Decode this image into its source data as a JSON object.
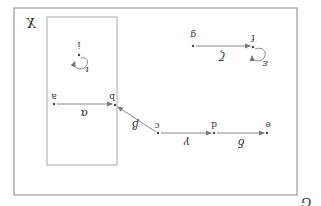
{
  "diagram": {
    "orientation": "rotated-180",
    "outer_box": {
      "label": "G",
      "x": 14,
      "y": 8,
      "w": 283,
      "h": 187
    },
    "inner_box": {
      "label": "X",
      "x": 47,
      "y": 17,
      "w": 70,
      "h": 148
    },
    "nodes": [
      {
        "id": "a",
        "label": "a",
        "x": 54,
        "y": 104
      },
      {
        "id": "b",
        "label": "b",
        "x": 115,
        "y": 106
      },
      {
        "id": "c",
        "label": "c",
        "x": 158,
        "y": 134
      },
      {
        "id": "d",
        "label": "d",
        "x": 214,
        "y": 133
      },
      {
        "id": "e",
        "label": "e",
        "x": 267,
        "y": 133
      },
      {
        "id": "g",
        "label": "g",
        "x": 193,
        "y": 45
      },
      {
        "id": "f",
        "label": "f",
        "x": 253,
        "y": 47
      },
      {
        "id": "i",
        "label": "i",
        "x": 79,
        "y": 56
      }
    ],
    "edges": [
      {
        "from": "a",
        "to": "b",
        "label": "α"
      },
      {
        "from": "c",
        "to": "b",
        "label": "β"
      },
      {
        "from": "c",
        "to": "d",
        "label": "γ"
      },
      {
        "from": "d",
        "to": "e",
        "label": "δ"
      },
      {
        "from": "g",
        "to": "f",
        "label": "ζ"
      },
      {
        "from": "f",
        "to": "f",
        "label": "ε",
        "loop": true
      },
      {
        "from": "i",
        "to": "i",
        "label": "ι",
        "loop": true
      }
    ],
    "colors": {
      "line": "#888888",
      "box": "#999999",
      "text": "#333333"
    }
  }
}
